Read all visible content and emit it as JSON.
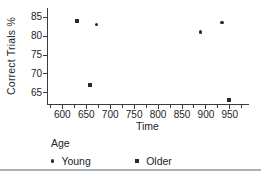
{
  "chart_data": {
    "type": "scatter",
    "title": "",
    "xlabel": "Time",
    "ylabel": "Correct Trials %",
    "xlim": [
      570,
      990
    ],
    "ylim": [
      62,
      87.5
    ],
    "x_ticks": [
      600,
      650,
      700,
      750,
      800,
      850,
      900,
      950
    ],
    "x_minor_ticks": [
      575,
      625,
      675,
      725,
      775,
      825,
      875,
      925,
      975
    ],
    "y_ticks": [
      65,
      70,
      75,
      80,
      85
    ],
    "grid": false,
    "marker_color": "#2b2b2b",
    "legend": {
      "title": "Age",
      "position": "bottom"
    },
    "series": [
      {
        "name": "Young",
        "marker": "circle",
        "points": [
          [
            672,
            83
          ],
          [
            890,
            81
          ],
          [
            935,
            83.5
          ]
        ]
      },
      {
        "name": "Older",
        "marker": "square",
        "points": [
          [
            630,
            84
          ],
          [
            658,
            67
          ],
          [
            948,
            63
          ]
        ]
      }
    ]
  }
}
